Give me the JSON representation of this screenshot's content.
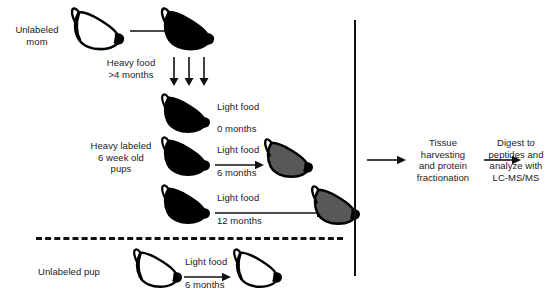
{
  "figure": {
    "colors": {
      "unlabeled_mouse_fill": "#ffffff",
      "unlabeled_mouse_stroke": "#000000",
      "heavy_mouse_fill": "#000000",
      "partially_labeled_mouse_fill": "#585858",
      "partially_labeled_mouse_stroke": "#000000",
      "line": "#111111",
      "text": "#1a1a1a"
    }
  },
  "left_panel": {
    "mom_label": "Unlabeled\nmom",
    "heavy_food_label": "Heavy food\n>4 months",
    "pups_label": "Heavy labeled\n6 week old\npups",
    "unlabeled_pup_label": "Unlabeled pup",
    "chase_rows": [
      {
        "diet": "Light food",
        "duration": "0 months"
      },
      {
        "diet": "Light food",
        "duration": "6 months"
      },
      {
        "diet": "Light food",
        "duration": "12 months"
      }
    ],
    "control_row": {
      "diet": "Light food",
      "duration": "6 months"
    }
  },
  "right_panel": {
    "step_1": "Tissue\nharvesting\nand protein\nfractionation",
    "step_2": "Digest to\npeptides and\nanalyze with\nLC-MS/MS"
  }
}
